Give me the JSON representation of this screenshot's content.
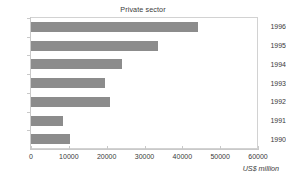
{
  "chart_data": {
    "type": "bar",
    "orientation": "horizontal",
    "title": "Private sector",
    "xlabel": "US$ million",
    "ylabel": "",
    "categories": [
      "1996",
      "1995",
      "1994",
      "1993",
      "1992",
      "1991",
      "1990"
    ],
    "values": [
      44200,
      33700,
      24000,
      19500,
      20800,
      8400,
      10300
    ],
    "xlim": [
      0,
      60000
    ],
    "xticks": [
      0,
      10000,
      20000,
      30000,
      40000,
      50000,
      60000
    ],
    "xtick_labels": [
      "0",
      "10000",
      "20000",
      "30000",
      "40000",
      "50000",
      "60000"
    ],
    "grid": false,
    "legend": null,
    "bar_color": "#8c8c8c",
    "frame_color": "#d2d2d2",
    "text_color": "#3a3a3a",
    "background": "#ffffff"
  }
}
